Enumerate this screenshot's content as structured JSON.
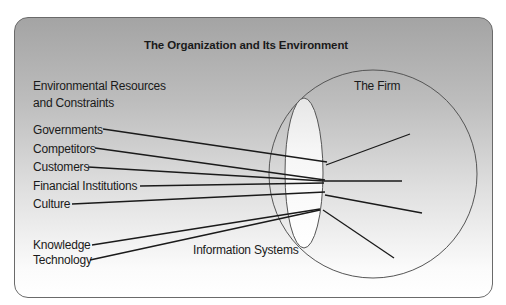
{
  "title": "The Organization and Its Environment",
  "environment_heading": {
    "line1": "Environmental Resources",
    "line2": "and Constraints"
  },
  "firm_label": "The Firm",
  "information_systems_label": "Information Systems",
  "factors": [
    {
      "label": "Governments"
    },
    {
      "label": "Competitors"
    },
    {
      "label": "Customers"
    },
    {
      "label": "Financial Institutions"
    },
    {
      "label": "Culture"
    },
    {
      "label": "Knowledge"
    },
    {
      "label": "Technology"
    }
  ],
  "colors": {
    "frame_border": "#6a6a6a",
    "gradient_top": "#a4a4a4",
    "gradient_bottom": "#ffffff",
    "line": "#1a1a1a",
    "circle_stroke": "#555555",
    "lens_fill": "#fafafa"
  }
}
